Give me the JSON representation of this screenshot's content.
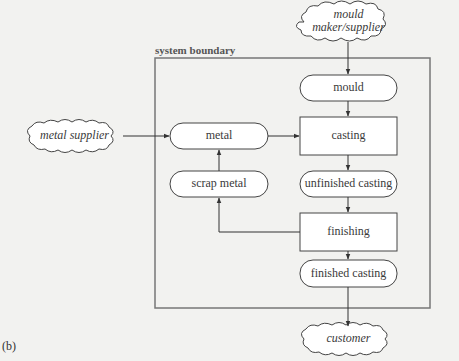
{
  "panel_label": "(b)",
  "boundary": {
    "label": "system boundary"
  },
  "external": {
    "mould_supplier": {
      "line1": "mould",
      "line2": "maker/supplier"
    },
    "metal_supplier": "metal supplier",
    "customer": "customer"
  },
  "nodes": {
    "mould": "mould",
    "casting": "casting",
    "unfinished_casting": "unfinished casting",
    "finishing": "finishing",
    "finished_casting": "finished casting",
    "metal": "metal",
    "scrap_metal": "scrap metal"
  },
  "colors": {
    "background": "#f2f2f0",
    "stroke": "#555555",
    "fill": "#ffffff",
    "boundary": "#777777"
  }
}
